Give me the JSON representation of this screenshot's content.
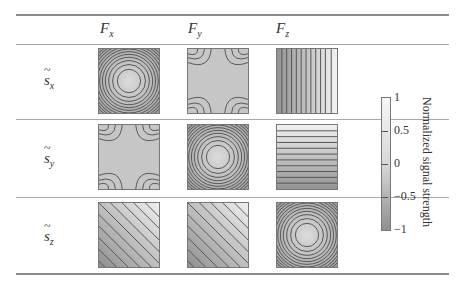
{
  "table": {
    "columns": [
      {
        "label": "F",
        "sub": "x"
      },
      {
        "label": "F",
        "sub": "y"
      },
      {
        "label": "F",
        "sub": "z"
      }
    ],
    "rows": [
      {
        "label": "s",
        "sub": "x",
        "cells": [
          "concentric-circles",
          "saddle-x",
          "vertical-stripes"
        ]
      },
      {
        "label": "s",
        "sub": "y",
        "cells": [
          "saddle-y",
          "concentric-circles",
          "horizontal-stripes"
        ]
      },
      {
        "label": "s",
        "sub": "z",
        "cells": [
          "diagonal-stripes",
          "diagonal-stripes",
          "concentric-circles"
        ]
      }
    ]
  },
  "colorbar": {
    "title": "Normalized signal strength",
    "ticks": [
      "1",
      "0.5",
      "0",
      "−0.5",
      "−1"
    ],
    "range": [
      -1,
      1
    ],
    "colors": {
      "max": "#f6f6f6",
      "mid": "#d7d7d7",
      "min": "#8f8f8f"
    }
  }
}
